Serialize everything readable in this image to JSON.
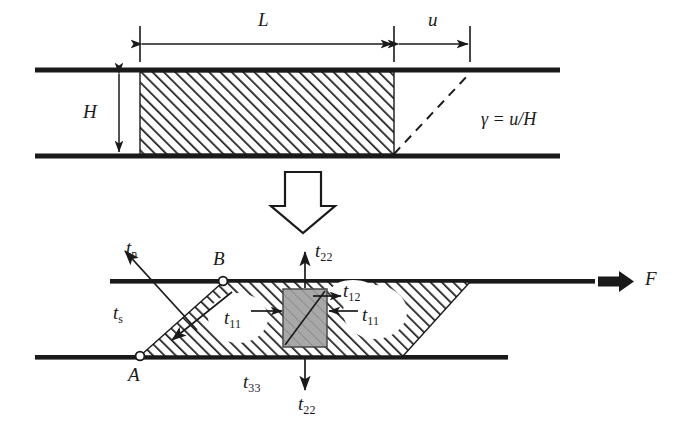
{
  "figure": {
    "background_color": "#ffffff",
    "ink_color": "#1a1a1a",
    "hatch_color": "#1a1a1a",
    "gray_element_fill": "#a8a8a8"
  },
  "top_panel": {
    "description": "Undeformed block of height H and length L sheared by displacement u",
    "labels": {
      "length": "L",
      "displacement": "u",
      "height": "H",
      "shear_strain_symbol": "γ",
      "shear_strain_equals": "=",
      "shear_strain_value": "u/H",
      "shear_strain_full": "γ = u/H"
    },
    "dimension_lines": [
      {
        "name": "L",
        "label": "L",
        "x_start": 140,
        "x_end": 394,
        "y": 42
      },
      {
        "name": "u",
        "label": "u",
        "x_start": 398,
        "x_end": 470,
        "y": 42
      },
      {
        "name": "H",
        "label": "H",
        "y_start": 72,
        "y_end": 154,
        "x": 119
      }
    ],
    "block": {
      "x": 140,
      "y": 72,
      "width": 254,
      "height": 82
    },
    "plates": {
      "top": {
        "x_start": 35,
        "x_end": 560,
        "y": 70
      },
      "bottom": {
        "x_start": 35,
        "x_end": 560,
        "y": 156
      }
    },
    "dashed_shear_line": {
      "x1": 394,
      "y1": 154,
      "x2": 470,
      "y2": 73
    }
  },
  "transition": {
    "icon": "hollow-down-arrow",
    "meaning": "leads to"
  },
  "bottom_panel": {
    "description": "Sheared parallelogram with traction and stress components marked",
    "labels": {
      "traction_normal": "t",
      "traction_normal_sub": "n",
      "traction_shear": "t",
      "traction_shear_sub": "s",
      "point_b": "B",
      "point_a": "A",
      "stress_22_top": "t",
      "stress_22_top_sub": "22",
      "stress_22_bottom": "t",
      "stress_22_bottom_sub": "22",
      "stress_12": "t",
      "stress_12_sub": "12",
      "stress_11_left": "t",
      "stress_11_left_sub": "11",
      "stress_11_right": "t",
      "stress_11_right_sub": "11",
      "stress_33": "t",
      "stress_33_sub": "33",
      "force": "F"
    },
    "label_texts": {
      "tn": "tn",
      "ts": "ts",
      "t22_top": "t22",
      "t22_bottom": "t22",
      "t12": "t12",
      "t11_left": "t11",
      "t11_right": "t11",
      "t33": "t33",
      "A": "A",
      "B": "B",
      "F": "F"
    },
    "parallelogram": {
      "bottom_left": [
        140,
        356
      ],
      "top_left": [
        223,
        282
      ],
      "top_right": [
        470,
        282
      ],
      "bottom_right": [
        403,
        356
      ]
    },
    "plates": {
      "top": {
        "x_start": 110,
        "x_end": 595,
        "y": 281
      },
      "bottom": {
        "x_start": 35,
        "x_end": 508,
        "y": 357
      }
    },
    "gray_element": {
      "x": 283,
      "y": 289,
      "width": 44,
      "height": 58
    },
    "force_arrow": {
      "x_start": 598,
      "x_end": 634,
      "y": 281,
      "style": "solid-bold"
    }
  }
}
